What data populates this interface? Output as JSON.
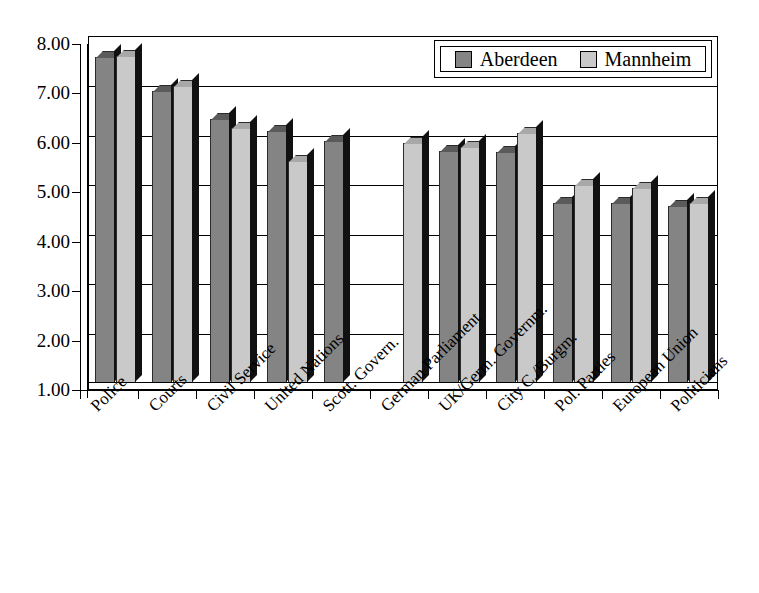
{
  "chart_data": {
    "type": "bar",
    "title": "",
    "subtitle": "",
    "xlabel": "",
    "ylabel": "",
    "ylim": [
      1.0,
      8.0
    ],
    "ytick_step": 1.0,
    "ytick_labels": [
      "8.00",
      "7.00",
      "6.00",
      "5.00",
      "4.00",
      "3.00",
      "2.00",
      "1.00"
    ],
    "ytick_values": [
      8.0,
      7.0,
      6.0,
      5.0,
      4.0,
      3.0,
      2.0,
      1.0
    ],
    "grid": true,
    "grid_axis": "y",
    "legend_position": "top-right",
    "style": "3d-column",
    "categories": [
      "Police",
      "Courts",
      "Civil Service",
      "United Nations",
      "Scott. Govern.",
      "German Parliament",
      "UK/Germ. Governm.",
      "City C./Burgm.",
      "Pol. Parties",
      "European Union",
      "Politicians"
    ],
    "series": [
      {
        "name": "Aberdeen",
        "color": "#848484",
        "values": [
          7.6,
          6.9,
          6.35,
          6.1,
          5.9,
          null,
          5.7,
          5.68,
          4.65,
          4.65,
          4.58
        ]
      },
      {
        "name": "Mannheim",
        "color": "#c9c9c9",
        "values": [
          7.62,
          7.0,
          6.15,
          5.5,
          null,
          5.85,
          5.78,
          6.05,
          5.0,
          4.95,
          4.65
        ]
      }
    ]
  },
  "legend": {
    "entries": [
      {
        "label": "Aberdeen",
        "color": "#848484"
      },
      {
        "label": "Mannheim",
        "color": "#c9c9c9"
      }
    ]
  }
}
